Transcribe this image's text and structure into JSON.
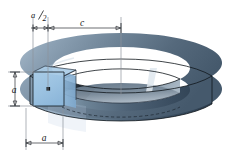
{
  "figure": {
    "shape_name": "circular ring with square cross section",
    "labels": {
      "half_width": "a/2",
      "half_width_numerator": "a",
      "half_width_denominator": "2",
      "mean_radius": "c",
      "height": "a",
      "width": "a"
    },
    "dimensions": [
      {
        "name": "half-width-dimension",
        "label": "a/2",
        "orientation": "horizontal",
        "position": "top-left"
      },
      {
        "name": "mean-radius-dimension",
        "label": "c",
        "orientation": "horizontal",
        "position": "top"
      },
      {
        "name": "height-dimension",
        "label": "a",
        "orientation": "vertical",
        "position": "left"
      },
      {
        "name": "width-dimension",
        "label": "a",
        "orientation": "horizontal",
        "position": "bottom-left"
      }
    ],
    "colors": {
      "cross_section_fill": "#9cc3e2",
      "cross_section_stroke": "#16202a",
      "top_ring_light": "#8fa4b6",
      "top_ring_dark": "#53687c",
      "inner_wall": "#5d7184",
      "inner_bottom": "#9aa9b6",
      "outer_wall_dark": "#2f4052",
      "outer_wall_mid": "#4a5f73",
      "background": "#ffffff",
      "line": "#2b2f33",
      "extension_line": "#8e949b"
    },
    "markers": [
      {
        "name": "centroid-dot",
        "shape": "square-dot",
        "color": "#101418"
      }
    ]
  }
}
